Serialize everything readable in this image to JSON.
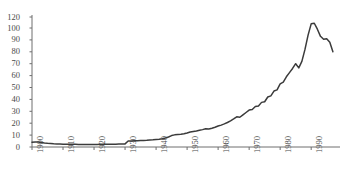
{
  "chart_data": {
    "type": "line",
    "title": "",
    "subtitle": "",
    "xlabel": "",
    "ylabel": "",
    "xlim": [
      1900,
      1998
    ],
    "ylim": [
      0,
      120
    ],
    "grid": false,
    "legend": null,
    "legend_position": "none",
    "annotations": [],
    "series_color": "#3b3b3b",
    "axis_color": "#6e6e6e",
    "y_ticks": [
      0,
      10,
      20,
      30,
      40,
      50,
      60,
      70,
      80,
      90,
      100,
      120
    ],
    "y_tick_labels": [
      "0",
      "10",
      "20",
      "30",
      "40",
      "50",
      "60",
      "70",
      "80",
      "90",
      "100",
      "120"
    ],
    "x_ticks": [
      1900,
      1910,
      1920,
      1930,
      1940,
      1950,
      1960,
      1970,
      1980,
      1990
    ],
    "x_tick_labels": [
      "1900",
      "1910",
      "1920",
      "1930",
      "1940",
      "1950",
      "1960",
      "1970",
      "1980",
      "1990"
    ],
    "x": [
      1900,
      1901,
      1902,
      1903,
      1904,
      1905,
      1906,
      1907,
      1908,
      1909,
      1910,
      1911,
      1912,
      1913,
      1914,
      1915,
      1916,
      1917,
      1918,
      1919,
      1920,
      1921,
      1922,
      1923,
      1924,
      1925,
      1926,
      1927,
      1928,
      1929,
      1930,
      1931,
      1932,
      1933,
      1934,
      1935,
      1936,
      1937,
      1938,
      1939,
      1940,
      1941,
      1942,
      1943,
      1944,
      1945,
      1946,
      1947,
      1948,
      1949,
      1950,
      1951,
      1952,
      1953,
      1954,
      1955,
      1956,
      1957,
      1958,
      1959,
      1960,
      1961,
      1962,
      1963,
      1964,
      1965,
      1966,
      1967,
      1968,
      1969,
      1970,
      1971,
      1972,
      1973,
      1974,
      1975,
      1976,
      1977,
      1978,
      1979,
      1980,
      1981,
      1982,
      1983,
      1984,
      1985,
      1986,
      1987,
      1988,
      1989,
      1990,
      1991,
      1992,
      1993,
      1994,
      1995,
      1996,
      1997
    ],
    "values": [
      4.0,
      4.3,
      4.2,
      3.8,
      3.4,
      3.1,
      2.9,
      2.7,
      2.6,
      2.5,
      2.4,
      2.4,
      2.3,
      2.3,
      2.3,
      2.2,
      2.2,
      2.2,
      2.2,
      2.2,
      2.2,
      2.2,
      2.3,
      2.3,
      2.3,
      2.4,
      2.4,
      2.4,
      2.5,
      2.5,
      2.6,
      5.0,
      5.1,
      5.2,
      5.3,
      5.4,
      5.5,
      5.6,
      5.8,
      6.0,
      6.3,
      6.6,
      7.0,
      7.6,
      8.4,
      9.6,
      10.2,
      10.5,
      10.8,
      11.2,
      11.8,
      12.6,
      13.0,
      13.4,
      14.0,
      14.6,
      15.4,
      15.2,
      15.8,
      16.6,
      17.6,
      18.4,
      19.4,
      20.6,
      22.0,
      23.6,
      25.4,
      25.0,
      27.0,
      29.0,
      31.0,
      31.5,
      34.0,
      34.5,
      37.5,
      38.0,
      42.0,
      43.0,
      47.0,
      48.0,
      53.0,
      54.5,
      59.0,
      62.5,
      66.0,
      70.0,
      66.5,
      72.0,
      82.0,
      94.0,
      103.5,
      104.0,
      99.0,
      93.0,
      90.5,
      91.0,
      88.0,
      80.0
    ],
    "series": [
      {
        "name": "series-1",
        "color": "#3b3b3b"
      }
    ]
  }
}
